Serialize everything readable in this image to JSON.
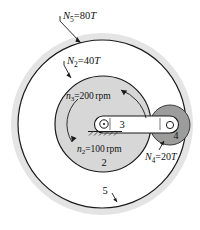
{
  "figure": {
    "background": "#ffffff",
    "colors": {
      "ring_band": "#e2e2e2",
      "ring_face": "#ffffff",
      "sun_gear": "#d4d4d4",
      "planet_gear": "#9a9a9a",
      "outline": "#1a1a1a",
      "text": "#111111",
      "arm": "#ffffff"
    }
  },
  "labels": {
    "ring_gear": {
      "symbol": "N",
      "sub": "5",
      "eq": "=",
      "value": "80",
      "unit": "T",
      "text": "N5 = 80T"
    },
    "sun_gear": {
      "symbol": "N",
      "sub": "2",
      "eq": "=",
      "value": "40",
      "unit": "T",
      "text": "N2 = 40T"
    },
    "planet_gear": {
      "symbol": "N",
      "sub": "4",
      "eq": "=",
      "value": "20",
      "unit": "T",
      "text": "N4 = 20T"
    },
    "arm_speed": {
      "symbol": "n",
      "sub": "3",
      "eq": "=",
      "value": "200",
      "unit": "rpm",
      "text": "n3 = 200 rpm"
    },
    "sun_speed": {
      "symbol": "n",
      "sub": "2",
      "eq": "=",
      "value": "100",
      "unit": "rpm",
      "text": "n2 = 100 rpm"
    },
    "body_arm": "3",
    "body_sun": "2",
    "body_ring": "5",
    "body_planet": "4"
  },
  "geometry": {
    "ring_outer": {
      "cx": 102,
      "cy": 124,
      "r": 92
    },
    "ring_circle": {
      "cx": 102,
      "cy": 124,
      "r": 84
    },
    "sun_circle": {
      "cx": 103,
      "cy": 124,
      "r": 48
    },
    "planet_circle": {
      "cx": 170,
      "cy": 125,
      "r": 20
    },
    "arm": {
      "x1": 103,
      "y1": 124,
      "x2": 170,
      "y2": 125,
      "half_width": 8
    }
  },
  "arrows": {
    "sun_rotation": "counter-clockwise",
    "arm_rotation": "counter-clockwise"
  }
}
